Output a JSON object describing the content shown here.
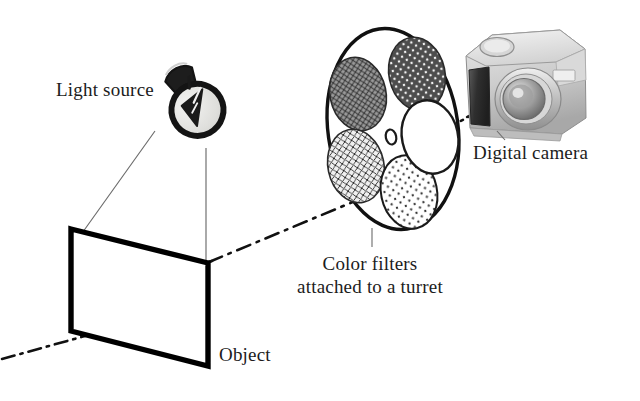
{
  "figure": {
    "background_color": "#ffffff",
    "ink_color": "#1c1c1c",
    "width": 640,
    "height": 401
  },
  "labels": {
    "light_source": "Light source",
    "digital_camera": "Digital camera",
    "object": "Object",
    "color_filters_line1": "Color filters",
    "color_filters_line2": "attached to a turret"
  },
  "components": {
    "light_source": {
      "name": "light-bulb",
      "bulb_fill": "#e3e3e1",
      "outline": "#141414",
      "base_fill": "#1d1d1d",
      "tilt_deg": -28
    },
    "object": {
      "name": "object-plane",
      "shape": "parallelogram",
      "stroke": "#000000",
      "stroke_width": 5,
      "fill": "#ffffff"
    },
    "turret": {
      "name": "filter-turret",
      "shape": "ellipse",
      "stroke": "#111111",
      "stroke_width": 3.2,
      "fill": "#ffffff",
      "center_hole": true,
      "filters": [
        {
          "position": "upper-left",
          "pattern": "fine-crosshatch",
          "fill": "#8e8e8e",
          "label": "filter-1"
        },
        {
          "position": "upper-right",
          "pattern": "dark-dots",
          "fill": "#4a4a4a",
          "label": "filter-2"
        },
        {
          "position": "lower-left",
          "pattern": "light-crosshatch",
          "fill": "#dedede",
          "label": "filter-3"
        },
        {
          "position": "bottom",
          "pattern": "sparse-dots",
          "fill": "#fbfbfb",
          "label": "filter-4"
        },
        {
          "position": "right",
          "pattern": "clear",
          "fill": "#ffffff",
          "label": "filter-5"
        }
      ]
    },
    "camera": {
      "name": "digital-camera",
      "body_fill": "#cfcfcf",
      "top_fill": "#e6e6e6",
      "grip_fill": "#3c3c3c",
      "lens_fill": "#b4b4b4",
      "lens_inner_fill": "#6e6e6e"
    }
  },
  "lines": {
    "optical_axis": {
      "name": "optical-axis",
      "style": "dash-dot",
      "stroke": "#111111",
      "stroke_width": 2.6
    },
    "illumination_rays": {
      "name": "illumination-ray",
      "style": "solid-thin",
      "stroke": "#6b6b6b",
      "stroke_width": 1.1
    },
    "leader": {
      "name": "leader-line",
      "style": "solid-thin",
      "stroke": "#6b6b6b",
      "stroke_width": 1.1
    }
  }
}
